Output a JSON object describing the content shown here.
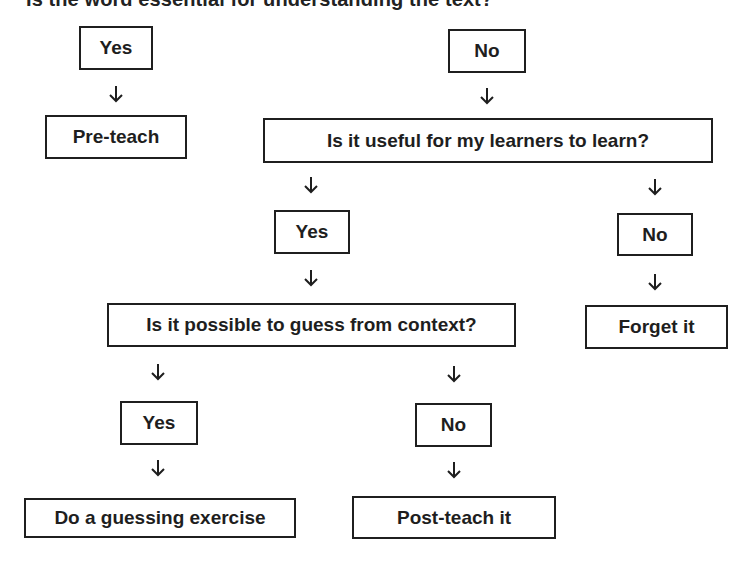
{
  "title": "Is the word essential for understanding the text?",
  "nodes": {
    "yes_essential": "Yes",
    "no_essential": "No",
    "pre_teach": "Pre-teach",
    "useful_question": "Is it useful for my learners to learn?",
    "yes_useful": "Yes",
    "no_useful": "No",
    "forget_it": "Forget it",
    "guess_question": "Is it possible to guess from context?",
    "yes_guess": "Yes",
    "no_guess": "No",
    "guessing_exercise": "Do a guessing exercise",
    "post_teach": "Post-teach it"
  },
  "edges": [
    {
      "from": "yes_essential",
      "to": "pre_teach"
    },
    {
      "from": "no_essential",
      "to": "useful_question"
    },
    {
      "from": "useful_question",
      "to": "yes_useful"
    },
    {
      "from": "useful_question",
      "to": "no_useful"
    },
    {
      "from": "no_useful",
      "to": "forget_it"
    },
    {
      "from": "yes_useful",
      "to": "guess_question"
    },
    {
      "from": "guess_question",
      "to": "yes_guess"
    },
    {
      "from": "guess_question",
      "to": "no_guess"
    },
    {
      "from": "yes_guess",
      "to": "guessing_exercise"
    },
    {
      "from": "no_guess",
      "to": "post_teach"
    }
  ],
  "icons": {
    "arrow": "down-arrow-icon"
  }
}
